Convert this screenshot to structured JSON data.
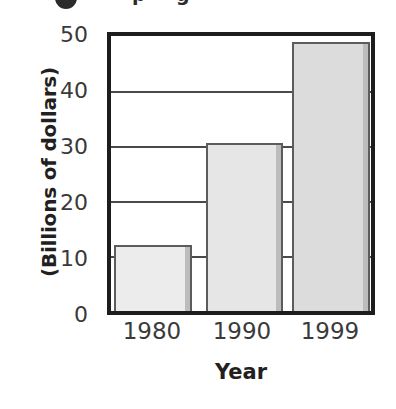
{
  "chart_data": {
    "type": "bar",
    "title": "",
    "subtitle": "",
    "categories": [
      "1980",
      "1990",
      "1999"
    ],
    "values": [
      12,
      30.5,
      49
    ],
    "xlabel": "Year",
    "ylabel": "(Billions of dollars)",
    "ylim": [
      0,
      50
    ],
    "yticks": [
      0,
      10,
      20,
      30,
      40,
      50
    ],
    "ytick_labels": [
      "0",
      "10",
      "20",
      "30",
      "40",
      "50"
    ],
    "grid": true,
    "grid_axis": "y",
    "legend": false,
    "legend_position": "none",
    "series": [
      {
        "name": "",
        "values": [
          12,
          30.5,
          49
        ]
      }
    ],
    "bar_fills": [
      "#ececec",
      "#e6e6e6",
      "#dcdcdc"
    ],
    "bar_edge_color": "#5c5c5c",
    "axis_color": "#1d1d1d",
    "grid_color": "#4a4a4a",
    "text_color": "#231f20",
    "background": "#ffffff"
  },
  "axes": {
    "y": {
      "title": "(Billions of dollars)",
      "ticks": [
        {
          "label": "50",
          "value": 50
        },
        {
          "label": "40",
          "value": 40
        },
        {
          "label": "30",
          "value": 30
        },
        {
          "label": "20",
          "value": 20
        },
        {
          "label": "10",
          "value": 10
        },
        {
          "label": "0",
          "value": 0
        }
      ]
    },
    "x": {
      "title": "Year",
      "ticks": [
        {
          "label": "1980"
        },
        {
          "label": "1990"
        },
        {
          "label": "1999"
        }
      ]
    }
  },
  "artifacts": {
    "top_cropped_bullet": "●",
    "top_cropped_glyph_1": "p",
    "top_cropped_glyph_2": "g"
  }
}
